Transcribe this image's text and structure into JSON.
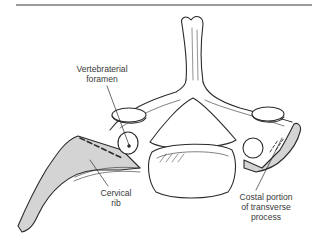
{
  "figure": {
    "colors": {
      "line": "#2b2b2b",
      "shading": "#d4d4d4",
      "rule": "#9a9a9a",
      "label_text": "#3a3a3a"
    }
  },
  "labels": {
    "foramen": {
      "line1": "Vertebraterial",
      "line2": "foramen"
    },
    "rib": {
      "line1": "Cervical",
      "line2": "rib"
    },
    "costal": {
      "line1": "Costal portion",
      "line2": "of transverse",
      "line3": "process"
    }
  }
}
